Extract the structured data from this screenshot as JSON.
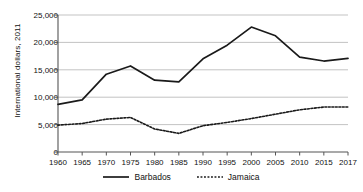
{
  "chart_data": {
    "type": "line",
    "title": "",
    "xlabel": "",
    "ylabel": "International dollars, 2011",
    "x": [
      1960,
      1965,
      1970,
      1975,
      1980,
      1985,
      1990,
      1995,
      2000,
      2005,
      2010,
      2015,
      2017
    ],
    "xtick_labels": [
      "1960",
      "1965",
      "1970",
      "1975",
      "1980",
      "1985",
      "1990",
      "1995",
      "2000",
      "2005",
      "2010",
      "2015",
      "2017"
    ],
    "ytick_labels": [
      "0",
      "5,000",
      "10,000",
      "15,000",
      "20,000",
      "25,000"
    ],
    "ytick_values": [
      0,
      5000,
      10000,
      15000,
      20000,
      25000
    ],
    "ylim": [
      0,
      25000
    ],
    "xlim": [
      1960,
      2017
    ],
    "grid": "horizontal",
    "legend_position": "bottom-center",
    "series": [
      {
        "name": "Barbados",
        "style": "solid",
        "color": "#1a1a1a",
        "values": [
          8700,
          9500,
          14200,
          15700,
          13100,
          12800,
          17000,
          19500,
          22800,
          21200,
          17300,
          16600,
          17100
        ]
      },
      {
        "name": "Jamaica",
        "style": "dotted",
        "color": "#1a1a1a",
        "values": [
          4900,
          5200,
          6000,
          6300,
          4200,
          3400,
          4800,
          5400,
          6100,
          6900,
          7700,
          8200,
          8200
        ]
      }
    ]
  }
}
